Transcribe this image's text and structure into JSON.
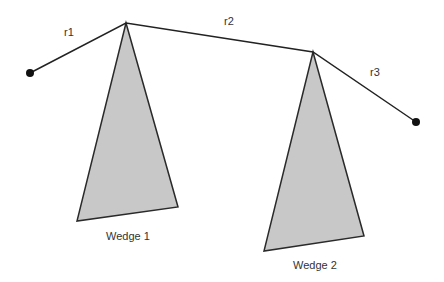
{
  "diagram": {
    "colors": {
      "line": "#222222",
      "wedge_fill": "#c8c8c8",
      "wedge_stroke": "#2a2a2a",
      "text": "#333333"
    },
    "chain": {
      "points": [
        [
          30,
          73
        ],
        [
          126,
          23
        ],
        [
          313,
          52
        ],
        [
          416,
          122
        ]
      ],
      "segments": [
        {
          "label": "r1",
          "x": 64,
          "y": 26
        },
        {
          "label": "r2",
          "x": 224,
          "y": 15
        },
        {
          "label": "r3",
          "x": 370,
          "y": 66
        }
      ]
    },
    "wedges": [
      {
        "label": "Wedge 1",
        "points": [
          [
            126,
            23
          ],
          [
            77,
            221
          ],
          [
            178,
            207
          ]
        ],
        "label_x": 106,
        "label_y": 230
      },
      {
        "label": "Wedge 2",
        "points": [
          [
            313,
            52
          ],
          [
            264,
            251
          ],
          [
            364,
            236
          ]
        ],
        "label_x": 293,
        "label_y": 259
      }
    ]
  }
}
